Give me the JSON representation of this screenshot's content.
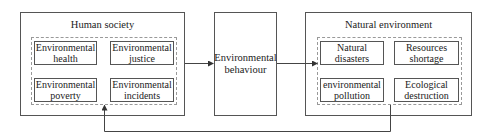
{
  "diagram": {
    "human_society": {
      "title": "Human society",
      "items": [
        {
          "line1": "Environmental",
          "line2": "health"
        },
        {
          "line1": "Environmental",
          "line2": "justice"
        },
        {
          "line1": "Environmental",
          "line2": "poverty"
        },
        {
          "line1": "Environmental",
          "line2": "incidents"
        }
      ]
    },
    "environmental_behaviour": {
      "line1": "Environmental",
      "line2": "behaviour"
    },
    "natural_environment": {
      "title": "Natural environment",
      "items": [
        {
          "line1": "Natural",
          "line2": "disasters"
        },
        {
          "line1": "Resources",
          "line2": "shortage"
        },
        {
          "line1": "environmental",
          "line2": "pollution"
        },
        {
          "line1": "Ecological",
          "line2": "destruction"
        }
      ]
    },
    "arrows": [
      {
        "from": "Human society",
        "to": "Environmental behaviour"
      },
      {
        "from": "Environmental behaviour",
        "to": "Natural environment"
      },
      {
        "from": "Natural environment",
        "to": "Human society",
        "type": "feedback"
      }
    ],
    "colors": {
      "line": "#555555",
      "dashed": "#999999"
    }
  }
}
